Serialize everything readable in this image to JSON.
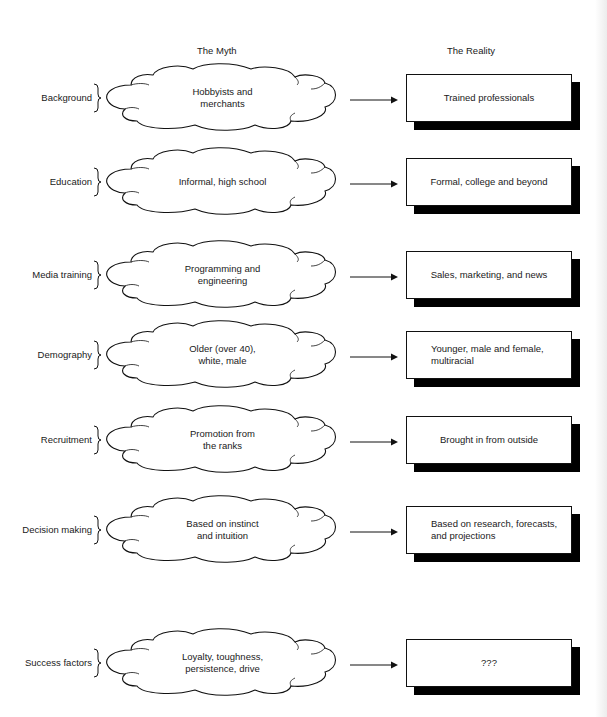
{
  "headers": {
    "myth": "The Myth",
    "reality": "The Reality"
  },
  "rows": [
    {
      "label": "Background",
      "myth": "Hobbyists and\nmerchants",
      "reality": "Trained professionals",
      "reality_align": "center"
    },
    {
      "label": "Education",
      "myth": "Informal, high school",
      "reality": "Formal, college and beyond",
      "reality_align": "center"
    },
    {
      "label": "Media training",
      "myth": "Programming and\nengineering",
      "reality": "Sales, marketing, and news",
      "reality_align": "center"
    },
    {
      "label": "Demography",
      "myth": "Older (over 40),\nwhite, male",
      "reality": "Younger, male and female,\nmultiracial",
      "reality_align": "left"
    },
    {
      "label": "Recruitment",
      "myth": "Promotion from\nthe ranks",
      "reality": "Brought in from outside",
      "reality_align": "center"
    },
    {
      "label": "Decision making",
      "myth": "Based on instinct\nand intuition",
      "reality": "Based on research, forecasts,\nand projections",
      "reality_align": "left"
    },
    {
      "label": "Success factors",
      "myth": "Loyalty, toughness,\npersistence, drive",
      "reality": "???",
      "reality_align": "center"
    }
  ],
  "icons": {
    "brace": "right-curly-brace",
    "arrow": "right-arrow"
  },
  "colors": {
    "line": "#111111",
    "shadow": "#000000",
    "background": "#ffffff"
  }
}
